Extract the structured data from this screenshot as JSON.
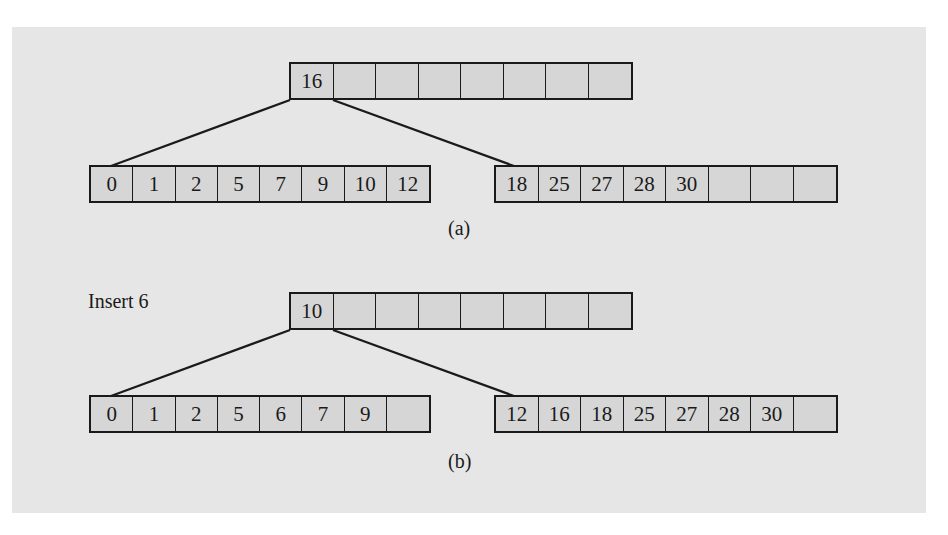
{
  "figure": {
    "part_a": {
      "caption": "(a)",
      "root": {
        "keys": [
          "16",
          "",
          "",
          "",
          "",
          "",
          "",
          ""
        ]
      },
      "leaves": [
        {
          "keys": [
            "0",
            "1",
            "2",
            "5",
            "7",
            "9",
            "10",
            "12"
          ]
        },
        {
          "keys": [
            "18",
            "25",
            "27",
            "28",
            "30",
            "",
            "",
            ""
          ]
        }
      ]
    },
    "part_b": {
      "caption": "(b)",
      "operation_label": "Insert 6",
      "root": {
        "keys": [
          "10",
          "",
          "",
          "",
          "",
          "",
          "",
          ""
        ]
      },
      "leaves": [
        {
          "keys": [
            "0",
            "1",
            "2",
            "5",
            "6",
            "7",
            "9",
            ""
          ]
        },
        {
          "keys": [
            "12",
            "16",
            "18",
            "25",
            "27",
            "28",
            "30",
            ""
          ]
        }
      ]
    }
  },
  "colors": {
    "panel_background": "#e6e6e6",
    "cell_fill": "#d6d6d6",
    "stroke": "#1a1a1a"
  }
}
